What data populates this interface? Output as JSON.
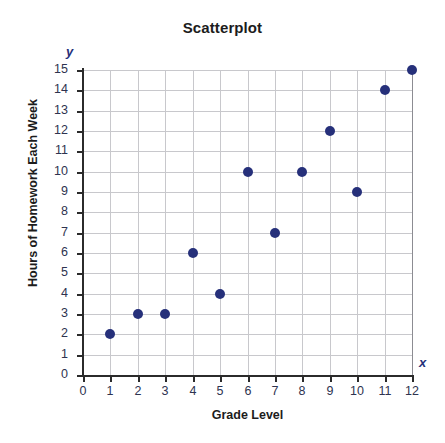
{
  "chart_data": {
    "type": "scatter",
    "title": "Scatterplot",
    "xlabel": "Grade Level",
    "ylabel": "Hours of Homework Each Week",
    "x_axis_letter": "x",
    "y_axis_letter": "y",
    "xlim": [
      0,
      12
    ],
    "ylim": [
      0,
      15
    ],
    "xticks": [
      0,
      1,
      2,
      3,
      4,
      5,
      6,
      7,
      8,
      9,
      10,
      11,
      12
    ],
    "yticks": [
      0,
      1,
      2,
      3,
      4,
      5,
      6,
      7,
      8,
      9,
      10,
      11,
      12,
      13,
      14,
      15
    ],
    "grid": true,
    "legend": null,
    "marker_color": "#26307a",
    "grid_color": "#c8c8cc",
    "axis_color": "#2b2b2b",
    "tick_label_color": "#2e3350",
    "x": [
      1,
      2,
      3,
      4,
      5,
      6,
      7,
      8,
      9,
      10,
      11,
      12
    ],
    "y": [
      2,
      3,
      3,
      6,
      4,
      10,
      7,
      10,
      12,
      9,
      14,
      15
    ],
    "points": [
      {
        "x": 1,
        "y": 2
      },
      {
        "x": 2,
        "y": 3
      },
      {
        "x": 3,
        "y": 3
      },
      {
        "x": 4,
        "y": 6
      },
      {
        "x": 5,
        "y": 4
      },
      {
        "x": 6,
        "y": 10
      },
      {
        "x": 7,
        "y": 7
      },
      {
        "x": 8,
        "y": 10
      },
      {
        "x": 9,
        "y": 12
      },
      {
        "x": 10,
        "y": 9
      },
      {
        "x": 11,
        "y": 14
      },
      {
        "x": 12,
        "y": 15
      }
    ]
  }
}
